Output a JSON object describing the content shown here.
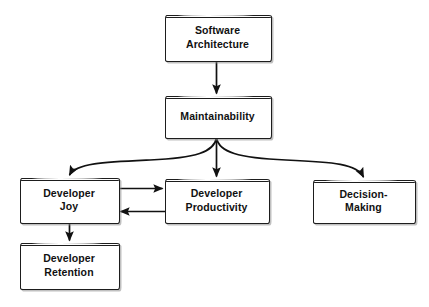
{
  "diagram": {
    "type": "flowchart",
    "background_color": "#ffffff",
    "node_fill": "#ffffff",
    "node_border_color": "#1d1d1d",
    "edge_color": "#111111",
    "text_color": "#111111",
    "nodes": [
      {
        "id": "software-architecture",
        "label": "Software\nArchitecture",
        "x": 165,
        "y": 15,
        "w": 105,
        "h": 45,
        "font_size": 10.5
      },
      {
        "id": "maintainability",
        "label": "Maintainability",
        "x": 165,
        "y": 96,
        "w": 105,
        "h": 41,
        "font_size": 10.5
      },
      {
        "id": "developer-joy",
        "label": "Developer\nJoy",
        "x": 20,
        "y": 178,
        "w": 98,
        "h": 44,
        "font_size": 10.5
      },
      {
        "id": "developer-productivity",
        "label": "Developer\nProductivity",
        "x": 165,
        "y": 179,
        "w": 103,
        "h": 43,
        "font_size": 10.5
      },
      {
        "id": "decision-making",
        "label": "Decision-\nMaking",
        "x": 313,
        "y": 180,
        "w": 101,
        "h": 42,
        "font_size": 10.5
      },
      {
        "id": "developer-retention",
        "label": "Developer\nRetention",
        "x": 20,
        "y": 243,
        "w": 98,
        "h": 45,
        "font_size": 10.5
      }
    ],
    "edges": [
      {
        "id": "arch-to-maint",
        "from": "software-architecture",
        "to": "maintainability",
        "style": "straight-vertical",
        "direction": "down"
      },
      {
        "id": "maint-to-joy",
        "from": "maintainability",
        "to": "developer-joy",
        "style": "curved-branch-left",
        "direction": "down"
      },
      {
        "id": "maint-to-productivity",
        "from": "maintainability",
        "to": "developer-productivity",
        "style": "straight-vertical",
        "direction": "down"
      },
      {
        "id": "maint-to-decision",
        "from": "maintainability",
        "to": "decision-making",
        "style": "curved-branch-right",
        "direction": "down"
      },
      {
        "id": "joy-to-productivity",
        "from": "developer-joy",
        "to": "developer-productivity",
        "style": "straight-horizontal",
        "direction": "right"
      },
      {
        "id": "productivity-to-joy",
        "from": "developer-productivity",
        "to": "developer-joy",
        "style": "straight-horizontal",
        "direction": "left"
      },
      {
        "id": "joy-to-retention",
        "from": "developer-joy",
        "to": "developer-retention",
        "style": "straight-vertical",
        "direction": "down"
      }
    ]
  }
}
